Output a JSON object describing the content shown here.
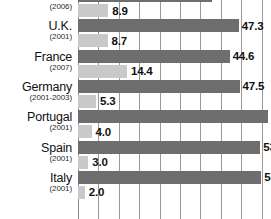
{
  "chart_data": {
    "type": "bar",
    "orientation": "horizontal",
    "grid": true,
    "legend_position": "none",
    "title": "",
    "xlabel": "",
    "ylabel": "",
    "xlim": [
      0,
      57
    ],
    "gridline_interval": 6,
    "categories": [
      "Canada",
      "U.K.",
      "France",
      "Germany",
      "Portugal",
      "Spain",
      "Italy"
    ],
    "category_years": [
      "(2006)",
      "(2001)",
      "(2007)",
      "(2001-2003)",
      "(2001)",
      "(2001)",
      "(2001)"
    ],
    "series": [
      {
        "name": "dark-series",
        "color": "#6e6e6e",
        "values": [
          39.3,
          47.3,
          44.6,
          47.5,
          56,
          53.6,
          53.9
        ],
        "labels": [
          "39.3",
          "47.3",
          "44.6",
          "47.5",
          "56",
          "53.6",
          "53.9"
        ]
      },
      {
        "name": "light-series",
        "color": "#c9c9c9",
        "values": [
          8.9,
          8.7,
          14.4,
          5.3,
          4.0,
          3.0,
          2.0
        ],
        "labels": [
          "8.9",
          "8.7",
          "14.4",
          "5.3",
          "4.0",
          "3.0",
          "2.0"
        ]
      }
    ],
    "notes": {
      "top_bar_clipped": "Canada dark bar is cut off at the top edge",
      "bottom_row_clipped": "Italy row is cut off at the bottom edge",
      "right_label_clipped": "Portugal value label 56 is cut off at the right edge"
    }
  },
  "colors": {
    "dark_bar": "#6e6e6e",
    "light_bar": "#c9c9c9",
    "gridline": "#9a9a9a",
    "background": "#ffffff",
    "text": "#111111"
  }
}
